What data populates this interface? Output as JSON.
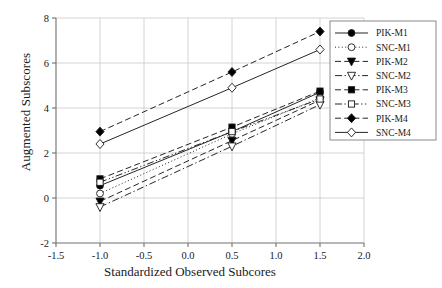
{
  "chart_data": {
    "type": "line",
    "title": "",
    "xlabel": "Standardized Observed Subcores",
    "ylabel": "Augmented Subscores",
    "x": [
      -1.0,
      0.5,
      1.5
    ],
    "xlim": [
      -1.5,
      2.0
    ],
    "ylim": [
      -2,
      8
    ],
    "xticks": [
      "-1.5",
      "-1.0",
      "-0.5",
      "0.0",
      "0.5",
      "1.0",
      "1.5",
      "2.0"
    ],
    "xtick_values": [
      -1.5,
      -1.0,
      -0.5,
      0.0,
      0.5,
      1.0,
      1.5,
      2.0
    ],
    "yticks": [
      "-2",
      "0",
      "2",
      "4",
      "6",
      "8"
    ],
    "ytick_values": [
      -2,
      0,
      2,
      4,
      6,
      8
    ],
    "grid": true,
    "legend_position": "upper right",
    "series": [
      {
        "name": "PIK-M1",
        "values": [
          0.55,
          2.95,
          4.7
        ],
        "marker": "filled-circle",
        "line": "solid"
      },
      {
        "name": "SNC-M1",
        "values": [
          0.2,
          2.85,
          4.45
        ],
        "marker": "open-circle",
        "line": "dotted"
      },
      {
        "name": "PIK-M2",
        "values": [
          -0.15,
          2.55,
          4.35
        ],
        "marker": "filled-triangle-down",
        "line": "dashed"
      },
      {
        "name": "SNC-M2",
        "values": [
          -0.4,
          2.3,
          4.15
        ],
        "marker": "open-triangle-down",
        "line": "dash-dot"
      },
      {
        "name": "PIK-M3",
        "values": [
          0.85,
          3.15,
          4.75
        ],
        "marker": "filled-square",
        "line": "dashed"
      },
      {
        "name": "SNC-M3",
        "values": [
          0.7,
          2.95,
          4.4
        ],
        "marker": "open-square",
        "line": "dash-dot-dot"
      },
      {
        "name": "PIK-M4",
        "values": [
          2.95,
          5.6,
          7.4
        ],
        "marker": "filled-diamond",
        "line": "dashed"
      },
      {
        "name": "SNC-M4",
        "values": [
          2.4,
          4.9,
          6.6
        ],
        "marker": "open-diamond",
        "line": "solid"
      }
    ],
    "colors": {
      "ink": "#1a1a1a",
      "grid": "#c9c9c9",
      "axis": "#707070",
      "marker_fill": "#000000",
      "marker_open": "#ffffff"
    }
  }
}
